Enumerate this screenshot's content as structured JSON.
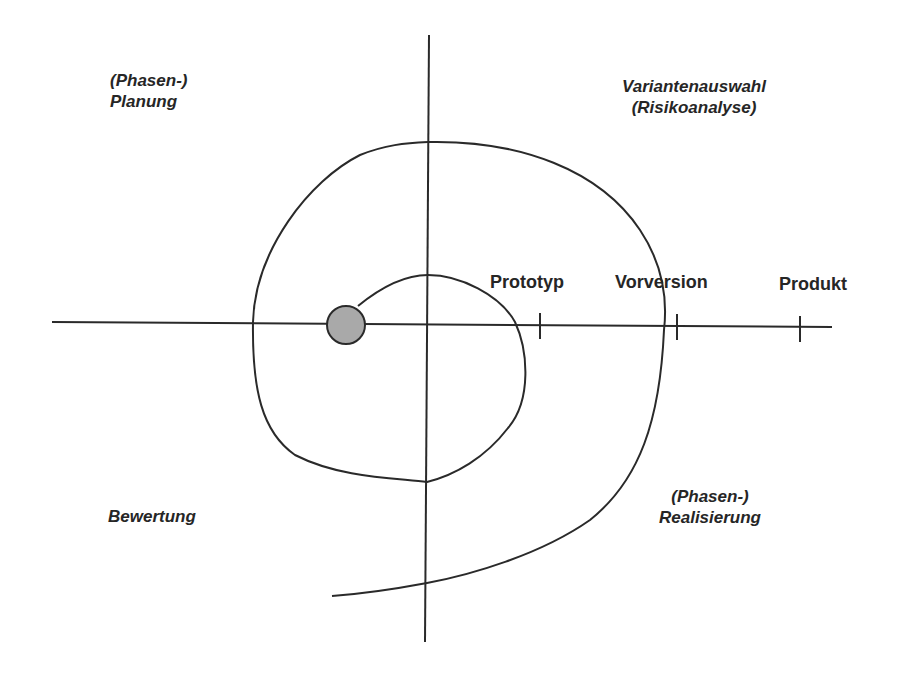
{
  "diagram": {
    "type": "spiral-model",
    "quadrants": {
      "top_left": {
        "line1": "(Phasen-)",
        "line2": "Planung"
      },
      "top_right": {
        "line1": "Variantenauswahl",
        "line2": "(Risikoanalyse)"
      },
      "bottom_left": {
        "line1": "Bewertung"
      },
      "bottom_right": {
        "line1": "(Phasen-)",
        "line2": "Realisierung"
      }
    },
    "milestones": [
      {
        "label": "Prototyp"
      },
      {
        "label": "Vorversion"
      },
      {
        "label": "Produkt"
      }
    ],
    "colors": {
      "line": "#2a2a2a",
      "start_dot_fill": "#a9a9a9",
      "background": "#ffffff"
    }
  }
}
